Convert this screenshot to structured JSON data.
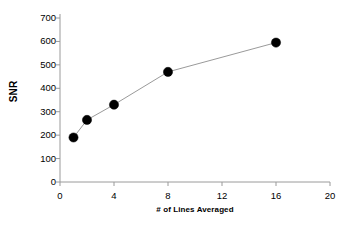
{
  "chart_data": {
    "type": "line",
    "title": "",
    "subtitle": "",
    "xlabel": "# of Lines Averaged",
    "ylabel": "SNR",
    "x": [
      1,
      2,
      4,
      8,
      16
    ],
    "values": [
      190,
      265,
      330,
      470,
      595
    ],
    "series": [
      {
        "name": "SNR",
        "x": [
          1,
          2,
          4,
          8,
          16
        ],
        "values": [
          190,
          265,
          330,
          470,
          595
        ]
      }
    ],
    "xlim": [
      0,
      20
    ],
    "ylim": [
      0,
      700
    ],
    "xticks": [
      0,
      4,
      8,
      12,
      16,
      20
    ],
    "yticks": [
      0,
      100,
      200,
      300,
      400,
      500,
      600,
      700
    ],
    "xtick_labels": [
      "0",
      "4",
      "8",
      "12",
      "16",
      "20"
    ],
    "ytick_labels": [
      "0",
      "100",
      "200",
      "300",
      "400",
      "500",
      "600",
      "700"
    ],
    "grid": false,
    "legend": false,
    "legend_position": "none",
    "marker": "filled-circle",
    "marker_color": "#000000",
    "line_color": "#9a9a9a",
    "axis_color": "#9a9a9a",
    "background_color": "#ffffff",
    "text_color": "#000000"
  }
}
